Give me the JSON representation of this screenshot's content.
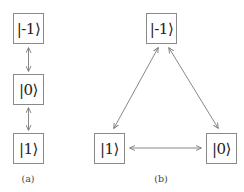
{
  "diagram_a": {
    "label": "(a)",
    "states": [
      {
        "id": "minus1",
        "text": "|-1⟩"
      },
      {
        "id": "zero",
        "text": "|0⟩"
      },
      {
        "id": "one",
        "text": "|1⟩"
      }
    ],
    "edges": [
      {
        "from": "minus1",
        "to": "zero",
        "type": "bidirectional"
      },
      {
        "from": "zero",
        "to": "one",
        "type": "bidirectional"
      }
    ]
  },
  "diagram_b": {
    "label": "(b)",
    "states": [
      {
        "id": "minus1",
        "text": "|-1⟩"
      },
      {
        "id": "one",
        "text": "|1⟩"
      },
      {
        "id": "zero",
        "text": "|0⟩"
      }
    ],
    "edges": [
      {
        "from": "minus1",
        "to": "one",
        "type": "bidirectional"
      },
      {
        "from": "minus1",
        "to": "zero",
        "type": "bidirectional"
      },
      {
        "from": "one",
        "to": "zero",
        "type": "bidirectional"
      }
    ]
  },
  "colors": {
    "box_border": "#8a8a8a",
    "arrow": "#7a7a7a",
    "text": "#222222"
  }
}
